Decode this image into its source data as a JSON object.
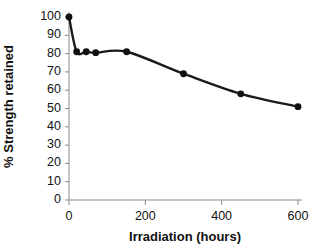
{
  "chart_data": {
    "type": "line",
    "title": "",
    "xlabel": "Irradiation (hours)",
    "ylabel": "% Strength retained",
    "xlim": [
      0,
      600
    ],
    "ylim": [
      0,
      100
    ],
    "xticks": [
      "0",
      "200",
      "400",
      "600"
    ],
    "xtick_values": [
      0,
      200,
      400,
      600
    ],
    "yticks": [
      "0",
      "10",
      "20",
      "30",
      "40",
      "50",
      "60",
      "70",
      "80",
      "90",
      "100"
    ],
    "ytick_values": [
      0,
      10,
      20,
      30,
      40,
      50,
      60,
      70,
      80,
      90,
      100
    ],
    "grid": false,
    "legend": "none",
    "series": [
      {
        "name": "% Strength retained",
        "color": "#1a1a1a",
        "marker": "filled-circle",
        "x": [
          0,
          20,
          45,
          70,
          151,
          300,
          450,
          600
        ],
        "y": [
          100,
          81,
          81,
          80.5,
          81,
          69,
          58,
          51
        ]
      }
    ]
  },
  "axis": {
    "y_title": "% Strength retained",
    "x_title": "Irradiation (hours)"
  },
  "colors": {
    "line": "#1a1a1a",
    "marker": "#111111",
    "axis": "#8a8a8a",
    "text": "#111111",
    "background": "#ffffff"
  }
}
